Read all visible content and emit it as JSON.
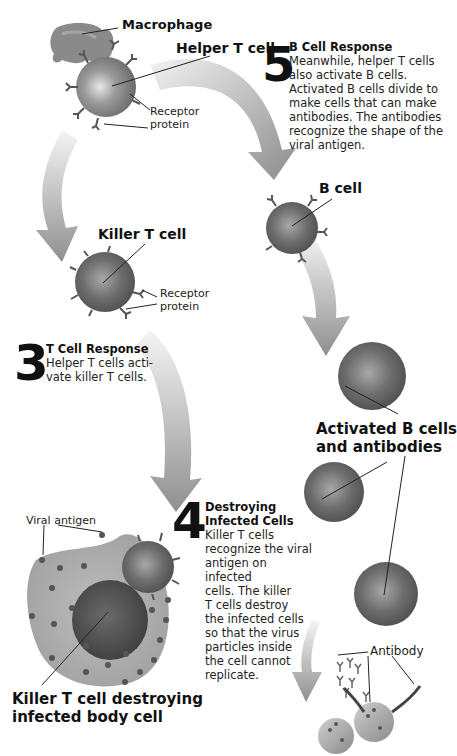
{
  "labels": {
    "macrophage": "Macrophage",
    "helper_t_cell": "Helper T cell",
    "receptor_protein_top_1": "Receptor",
    "receptor_protein_top_2": "protein",
    "killer_t_cell": "Killer T cell",
    "receptor_protein_mid_1": "Receptor",
    "receptor_protein_mid_2": "protein",
    "b_cell": "B cell",
    "activated_b_cells_1": "Activated B cells",
    "activated_b_cells_2": "and antibodies",
    "viral_antigen": "Viral antigen",
    "killer_destroying_1": "Killer T cell destroying",
    "killer_destroying_2": "infected body cell",
    "antibody": "Antibody"
  },
  "steps": [
    {
      "number": "5",
      "title": "B Cell Response",
      "lines": [
        "Meanwhile, helper T cells",
        "also activate B cells.",
        "Activated B cells divide to",
        "make cells that can make",
        "antibodies. The antibodies",
        "recognize the shape of the",
        "viral antigen."
      ]
    },
    {
      "number": "3",
      "title": "T Cell Response",
      "lines": [
        "Helper T cells acti-",
        "vate killer T cells."
      ]
    },
    {
      "number": "4",
      "title_lines": [
        "Destroying",
        "Infected Cells"
      ],
      "lines": [
        "Killer T cells",
        "recognize the viral",
        "antigen on infected",
        "cells. The killer",
        "T cells destroy",
        "the infected cells",
        "so that the virus",
        "particles inside",
        "the cell cannot",
        "replicate."
      ]
    }
  ],
  "colors": {
    "cell_gray": "#6e6e6e",
    "arrow_gray": "#9a9a9a",
    "text": "#111111"
  }
}
